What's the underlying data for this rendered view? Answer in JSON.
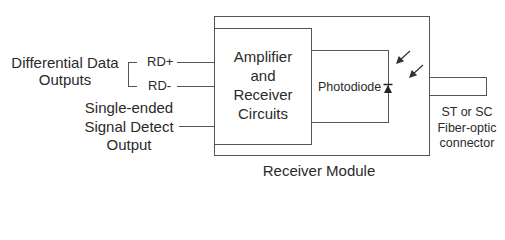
{
  "diagram": {
    "left_labels": {
      "differential_line1": "Differential Data",
      "differential_line2": "Outputs",
      "rd_plus": "RD+",
      "rd_minus": "RD-",
      "signal_line1": "Single-ended",
      "signal_line2": "Signal Detect",
      "signal_line3": "Output"
    },
    "amplifier": {
      "line1": "Amplifier",
      "line2": "and",
      "line3": "Receiver",
      "line4": "Circuits"
    },
    "photodiode_label": "Photodiode",
    "connector": {
      "line1": "ST or SC",
      "line2": "Fiber-optic",
      "line3": "connector"
    },
    "module_label": "Receiver Module",
    "colors": {
      "stroke": "#555555",
      "text": "#2a2a2a"
    }
  }
}
